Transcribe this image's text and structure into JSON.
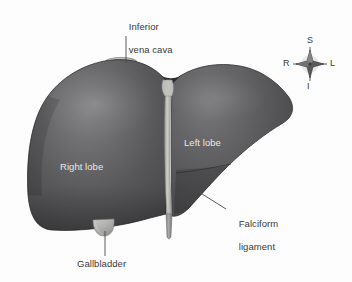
{
  "figure": {
    "background_color": "#fdfdfd"
  },
  "labels": {
    "inferior_vena_cava": {
      "line1": "Inferior",
      "line2": "vena cava",
      "color": "#3a3a3a"
    },
    "right_lobe": {
      "text": "Right lobe",
      "color": "#e8e8e8"
    },
    "left_lobe": {
      "text": "Left lobe",
      "color": "#e8e8e8"
    },
    "falciform_ligament": {
      "line1": "Falciform",
      "line2": "ligament",
      "color": "#3a3a3a"
    },
    "gallbladder": {
      "text": "Gallbladder",
      "color": "#3a3a3a"
    }
  },
  "compass": {
    "superior": "S",
    "inferior": "I",
    "right": "R",
    "left": "L",
    "star_color": "#4a4a4c",
    "label_color": "#39393b"
  },
  "colors": {
    "liver_dark": "#4b4b4d",
    "liver_mid": "#58585a",
    "liver_light": "#6e6e70",
    "liver_highlight": "#7d7d80",
    "liver_shadow": "#3c3c3e",
    "structure_gray": "#b4b4b2",
    "structure_gray_dark": "#9a9a98",
    "structure_gray_light": "#cfcfcd",
    "leader_line": "#4a4a4a",
    "outline": "#2e2e30"
  }
}
